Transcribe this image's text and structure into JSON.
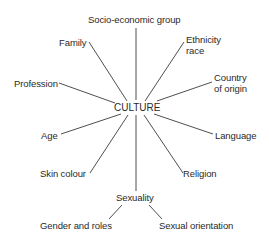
{
  "diagram": {
    "center": "CULTURE",
    "nodes": [
      {
        "id": "socio",
        "label": "Socio-economic group"
      },
      {
        "id": "family",
        "label": "Family"
      },
      {
        "id": "ethnicity",
        "line1": "Ethnicity",
        "line2": "race"
      },
      {
        "id": "profession",
        "label": "Profession"
      },
      {
        "id": "country",
        "line1": "Country",
        "line2": "of origin"
      },
      {
        "id": "age",
        "label": "Age"
      },
      {
        "id": "language",
        "label": "Language"
      },
      {
        "id": "skin",
        "label": "Skin colour"
      },
      {
        "id": "religion",
        "label": "Religion"
      },
      {
        "id": "sexuality",
        "label": "Sexuality"
      },
      {
        "id": "gender",
        "label": "Gender and roles"
      },
      {
        "id": "orientation",
        "label": "Sexual orientation"
      }
    ],
    "edges": [
      [
        "CULTURE",
        "Socio-economic group"
      ],
      [
        "CULTURE",
        "Family"
      ],
      [
        "CULTURE",
        "Ethnicity race"
      ],
      [
        "CULTURE",
        "Profession"
      ],
      [
        "CULTURE",
        "Country of origin"
      ],
      [
        "CULTURE",
        "Age"
      ],
      [
        "CULTURE",
        "Language"
      ],
      [
        "CULTURE",
        "Skin colour"
      ],
      [
        "CULTURE",
        "Religion"
      ],
      [
        "CULTURE",
        "Sexuality"
      ],
      [
        "Sexuality",
        "Gender and roles"
      ],
      [
        "Sexuality",
        "Sexual orientation"
      ]
    ],
    "line_color": "#3a3a3a",
    "text_color": "#2a2a2a"
  }
}
